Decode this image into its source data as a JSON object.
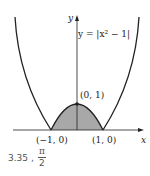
{
  "figure": {
    "equation_label": "y = |x² − 1|",
    "axis_x_label": "x",
    "axis_y_label": "y",
    "points": [
      {
        "label": "(0, 1)",
        "x": 0,
        "y": 1
      },
      {
        "label": "(−1, 0)",
        "x": -1,
        "y": 0
      },
      {
        "label": "(1, 0)",
        "x": 1,
        "y": 0
      }
    ],
    "shaded_region": "area under y = 1 − x² between x = −1 and x = 1",
    "colors": {
      "curve": "#222222",
      "shade": "#a8a8a8",
      "axis": "#222222"
    }
  },
  "answer": {
    "value": "3.35",
    "separator": ",",
    "fraction_numerator": "π",
    "fraction_denominator": "2"
  }
}
